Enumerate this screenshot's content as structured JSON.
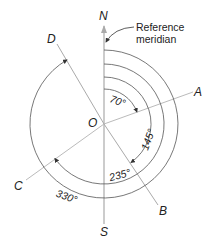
{
  "diagram": {
    "center_label": "O",
    "directions": {
      "north": "N",
      "south": "S"
    },
    "reference_label": [
      "Reference",
      "meridian"
    ],
    "lines": [
      {
        "label": "A",
        "azimuth": 70
      },
      {
        "label": "B",
        "azimuth": 145
      },
      {
        "label": "C",
        "azimuth": 235
      },
      {
        "label": "D",
        "azimuth": 330
      }
    ],
    "angles": [
      {
        "label": "70°",
        "value": 70
      },
      {
        "label": "145°",
        "value": 145
      },
      {
        "label": "235°",
        "value": 235
      },
      {
        "label": "330°",
        "value": 330
      }
    ],
    "colors": {
      "line": "#aaaaaa",
      "arc": "#555555",
      "text": "#222222"
    }
  }
}
